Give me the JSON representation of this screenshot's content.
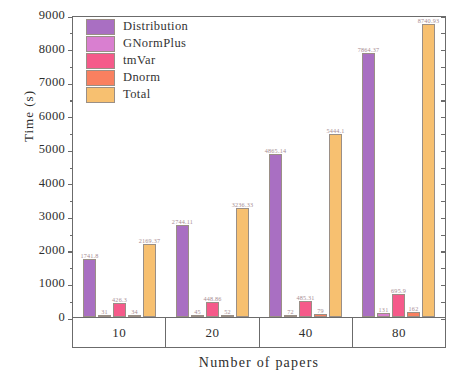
{
  "chart_data": {
    "type": "bar",
    "title": "",
    "xlabel": "Number of papers",
    "ylabel": "Time (s)",
    "categories": [
      "10",
      "20",
      "40",
      "80"
    ],
    "ylim": [
      0,
      9000
    ],
    "ytick_step": 1000,
    "yticks": [
      "0",
      "1000",
      "2000",
      "3000",
      "4000",
      "5000",
      "6000",
      "7000",
      "8000",
      "9000"
    ],
    "grid": false,
    "legend_position": "top-left",
    "series": [
      {
        "name": "Distribution",
        "color": "#a96fc2",
        "values": [
          1741.8,
          2744.11,
          4865.14,
          7864.37
        ],
        "labels": [
          "1741.8",
          "2744.11",
          "4865.14",
          "7864.37"
        ]
      },
      {
        "name": "GNormPlus",
        "color": "#d97fd0",
        "values": [
          31.0,
          45.0,
          72.0,
          131.0
        ],
        "labels": [
          "31",
          "45",
          "72",
          "131"
        ]
      },
      {
        "name": "tmVar",
        "color": "#f55a8a",
        "values": [
          426.3,
          448.86,
          485.31,
          695.9
        ],
        "labels": [
          "426.3",
          "448.86",
          "485.31",
          "695.9"
        ]
      },
      {
        "name": "Dnorm",
        "color": "#f98060",
        "values": [
          34.0,
          52.0,
          79.0,
          162.0
        ],
        "labels": [
          "34",
          "52",
          "79",
          "162"
        ]
      },
      {
        "name": "Total",
        "color": "#f7c070",
        "values": [
          2169.37,
          3236.33,
          5444.1,
          8740.93
        ],
        "labels": [
          "2169.37",
          "3236.33",
          "5444.1",
          "8740.93"
        ]
      }
    ]
  },
  "legend": {
    "items": [
      {
        "label": "Distribution",
        "color": "#a96fc2"
      },
      {
        "label": "GNormPlus",
        "color": "#d97fd0"
      },
      {
        "label": "tmVar",
        "color": "#f55a8a"
      },
      {
        "label": "Dnorm",
        "color": "#f98060"
      },
      {
        "label": "Total",
        "color": "#f7c070"
      }
    ]
  }
}
